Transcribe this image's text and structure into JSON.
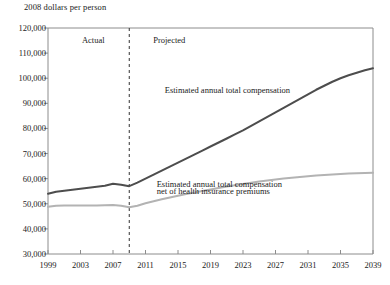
{
  "chart_data": {
    "type": "line",
    "title": "",
    "ylabel": "2008 dollars per person",
    "xlabel": "",
    "ylim": [
      30000,
      120000
    ],
    "xlim": [
      1999,
      2039
    ],
    "ytick_labels": [
      "120,000",
      "110,000",
      "100,000",
      "90,000",
      "80,000",
      "70,000",
      "60,000",
      "50,000",
      "40,000",
      "30,000"
    ],
    "ytick_values": [
      120000,
      110000,
      100000,
      90000,
      80000,
      70000,
      60000,
      50000,
      40000,
      30000
    ],
    "xtick_labels": [
      "1999",
      "2003",
      "2007",
      "2011",
      "2015",
      "2019",
      "2023",
      "2027",
      "2031",
      "2035",
      "2039"
    ],
    "xtick_values": [
      1999,
      2003,
      2007,
      2011,
      2015,
      2019,
      2023,
      2027,
      2031,
      2035,
      2039
    ],
    "grid": false,
    "legend_position": "inline-annotation",
    "divider": {
      "x": 2009,
      "style": "dashed",
      "label_left": "Actual",
      "label_right": "Projected"
    },
    "annotations": [
      {
        "name": "total-compensation-label",
        "text": "Estimated annual total compensation",
        "x": 2021,
        "y": 95000
      },
      {
        "name": "net-compensation-label-line1",
        "text": "Estimated annual total compensation",
        "x": 2020,
        "y": 57500
      },
      {
        "name": "net-compensation-label-line2",
        "text": "net of health insurance premiums",
        "x": 2020,
        "y": 54500
      }
    ],
    "x": [
      1999,
      2000,
      2001,
      2002,
      2003,
      2004,
      2005,
      2006,
      2007,
      2008,
      2009,
      2010,
      2011,
      2012,
      2013,
      2014,
      2015,
      2016,
      2017,
      2018,
      2019,
      2020,
      2021,
      2022,
      2023,
      2024,
      2025,
      2026,
      2027,
      2028,
      2029,
      2030,
      2031,
      2032,
      2033,
      2034,
      2035,
      2036,
      2037,
      2038,
      2039
    ],
    "series": [
      {
        "name": "Estimated annual total compensation",
        "color": "#4d4d4d",
        "width": 2.0,
        "values": [
          54000,
          54800,
          55200,
          55600,
          56000,
          56400,
          56800,
          57200,
          58000,
          57600,
          57000,
          58400,
          60000,
          61600,
          63200,
          64800,
          66400,
          68000,
          69600,
          71200,
          72800,
          74400,
          76000,
          77600,
          79200,
          81000,
          82800,
          84600,
          86400,
          88200,
          90000,
          91800,
          93600,
          95400,
          97000,
          98600,
          100000,
          101200,
          102200,
          103200,
          104000
        ]
      },
      {
        "name": "Estimated annual total compensation net of health insurance premiums",
        "color": "#b3b3b3",
        "width": 2.0,
        "values": [
          48800,
          49200,
          49300,
          49300,
          49300,
          49300,
          49300,
          49400,
          49500,
          49200,
          48600,
          49200,
          50200,
          51000,
          51800,
          52500,
          53200,
          53900,
          54500,
          55100,
          55700,
          56300,
          56900,
          57400,
          57900,
          58400,
          58900,
          59300,
          59700,
          60100,
          60400,
          60700,
          61000,
          61300,
          61500,
          61700,
          61900,
          62050,
          62150,
          62250,
          62350
        ]
      }
    ]
  },
  "plot": {
    "axis_color": "#8c8c8c",
    "text_color": "#1a1a1a",
    "background": "#ffffff"
  }
}
